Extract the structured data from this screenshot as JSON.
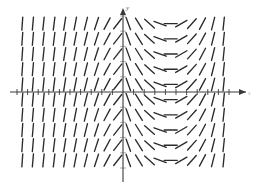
{
  "figure": {
    "title": "",
    "kind": "slope-field",
    "axis_labels": {
      "x": "x",
      "y": "y"
    },
    "colors": {
      "background": "#ffffff",
      "axis": "#3a3a3a",
      "tick": "#9a9a9a",
      "mark": "#2b2b2b"
    }
  },
  "chart_data": {
    "type": "scatter",
    "title": "",
    "xlabel": "x",
    "ylabel": "y",
    "grid": false,
    "legend": null,
    "xlim": [
      -10,
      10
    ],
    "ylim": [
      -5,
      5
    ],
    "origin_px": [
      123,
      92
    ],
    "px_per_unit_x": 10.6,
    "px_per_unit_y": 15.2,
    "mark_length_px": 13,
    "x": [
      -9.5,
      -8.5,
      -7.5,
      -6.5,
      -5.5,
      -4.5,
      -3.5,
      -2.5,
      -1.5,
      -0.5,
      0.5,
      1.5,
      2.5,
      3.5,
      4.5,
      5.5,
      6.5,
      7.5,
      8.5,
      9.5
    ],
    "y": [
      4.5,
      3.5,
      2.5,
      1.5,
      0.5,
      -0.5,
      -1.5,
      -2.5,
      -3.5,
      -4.5
    ],
    "slope_angles_deg_by_column": [
      86,
      85,
      84,
      83,
      81,
      79,
      76,
      72,
      62,
      52,
      -70,
      -58,
      -42,
      -20,
      0,
      30,
      48,
      62,
      76,
      84
    ],
    "series": [
      {
        "name": "direction field segments",
        "note": "Angle measured from the positive x-axis, in degrees; identical for every row."
      }
    ]
  }
}
